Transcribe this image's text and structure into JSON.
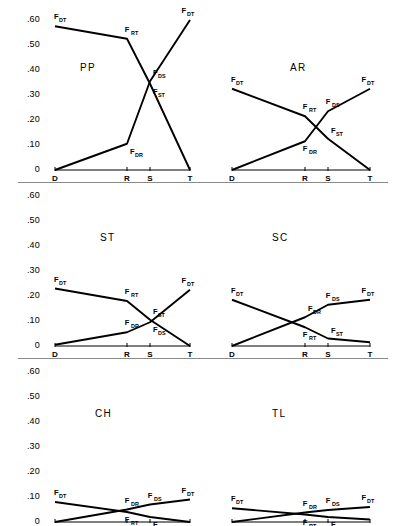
{
  "figure": {
    "axis_y_ticks": [
      ".60",
      ".50",
      ".40",
      ".30",
      ".20",
      ".10",
      "0"
    ],
    "axis_y_values": [
      0.6,
      0.5,
      0.4,
      0.3,
      0.2,
      0.1,
      0
    ],
    "axis_x_ticks": [
      "D",
      "R",
      "S",
      "T"
    ],
    "row_separator_color": "#8a8a8a",
    "line_color": "#000000"
  },
  "chart_data": [
    {
      "type": "line",
      "title": "PP",
      "panel": "top-left",
      "x": [
        "D",
        "R",
        "S",
        "T"
      ],
      "xlabel": "",
      "ylabel": "",
      "ylim": [
        0,
        0.6
      ],
      "grid": false,
      "legend": "inline-labels",
      "series": [
        {
          "name": "F_DT descending",
          "values": [
            0.575,
            0.525,
            0.345,
            0.0
          ],
          "labels": [
            {
              "text": "F",
              "sub": "DT",
              "at": "D",
              "pos": "above-left"
            },
            {
              "text": "F",
              "sub": "RT",
              "at": "R",
              "pos": "above"
            },
            {
              "text": "F",
              "sub": "ST",
              "at": "S",
              "pos": "below-right"
            }
          ]
        },
        {
          "name": "F_DR ascending",
          "values": [
            0.0,
            0.105,
            0.355,
            0.6
          ],
          "labels": [
            {
              "text": "F",
              "sub": "DR",
              "at": "R",
              "pos": "below-right"
            },
            {
              "text": "F",
              "sub": "DS",
              "at": "S",
              "pos": "above-right"
            },
            {
              "text": "F",
              "sub": "DT",
              "at": "T",
              "pos": "above"
            }
          ]
        }
      ]
    },
    {
      "type": "line",
      "title": "AR",
      "panel": "top-right",
      "x": [
        "D",
        "R",
        "S",
        "T"
      ],
      "xlabel": "",
      "ylabel": "",
      "ylim": [
        0,
        0.6
      ],
      "grid": false,
      "legend": "inline-labels",
      "series": [
        {
          "name": "F_DT descending",
          "values": [
            0.325,
            0.215,
            0.125,
            0.0
          ],
          "labels": [
            {
              "text": "F",
              "sub": "DT",
              "at": "D",
              "pos": "above-left"
            },
            {
              "text": "F",
              "sub": "RT",
              "at": "R",
              "pos": "above"
            },
            {
              "text": "F",
              "sub": "ST",
              "at": "S",
              "pos": "above-right"
            }
          ]
        },
        {
          "name": "F_DR ascending",
          "values": [
            0.0,
            0.115,
            0.235,
            0.325
          ],
          "labels": [
            {
              "text": "F",
              "sub": "DR",
              "at": "R",
              "pos": "below"
            },
            {
              "text": "F",
              "sub": "DS",
              "at": "S",
              "pos": "above"
            },
            {
              "text": "F",
              "sub": "DT",
              "at": "T",
              "pos": "above"
            }
          ]
        }
      ]
    },
    {
      "type": "line",
      "title": "ST",
      "panel": "middle-left",
      "x": [
        "D",
        "R",
        "S",
        "T"
      ],
      "xlabel": "",
      "ylabel": "",
      "ylim": [
        0,
        0.6
      ],
      "grid": false,
      "legend": "inline-labels",
      "series": [
        {
          "name": "F_DT descending",
          "values": [
            0.23,
            0.18,
            0.105,
            0.0
          ],
          "labels": [
            {
              "text": "F",
              "sub": "DT",
              "at": "D",
              "pos": "above-left"
            },
            {
              "text": "F",
              "sub": "RT",
              "at": "R",
              "pos": "above"
            },
            {
              "text": "F",
              "sub": "ST",
              "at": "S",
              "pos": "above-right"
            }
          ]
        },
        {
          "name": "F_DR ascending",
          "values": [
            0.005,
            0.055,
            0.095,
            0.225
          ],
          "labels": [
            {
              "text": "F",
              "sub": "DR",
              "at": "R",
              "pos": "above"
            },
            {
              "text": "F",
              "sub": "DS",
              "at": "S",
              "pos": "below-right"
            },
            {
              "text": "F",
              "sub": "DT",
              "at": "T",
              "pos": "above"
            }
          ]
        }
      ]
    },
    {
      "type": "line",
      "title": "SC",
      "panel": "middle-right",
      "x": [
        "D",
        "R",
        "S",
        "T"
      ],
      "xlabel": "",
      "ylabel": "",
      "ylim": [
        0,
        0.6
      ],
      "grid": false,
      "legend": "inline-labels",
      "series": [
        {
          "name": "F_DT descending",
          "values": [
            0.185,
            0.075,
            0.03,
            0.015
          ],
          "labels": [
            {
              "text": "F",
              "sub": "DT",
              "at": "D",
              "pos": "above-left"
            },
            {
              "text": "F",
              "sub": "RT",
              "at": "R",
              "pos": "below"
            },
            {
              "text": "F",
              "sub": "ST",
              "at": "S",
              "pos": "above-right"
            }
          ]
        },
        {
          "name": "F_DR ascending",
          "values": [
            0.0,
            0.115,
            0.165,
            0.185
          ],
          "labels": [
            {
              "text": "F",
              "sub": "DR",
              "at": "R",
              "pos": "above-right"
            },
            {
              "text": "F",
              "sub": "DS",
              "at": "S",
              "pos": "above"
            },
            {
              "text": "F",
              "sub": "DT",
              "at": "T",
              "pos": "above"
            }
          ]
        }
      ]
    },
    {
      "type": "line",
      "title": "CH",
      "panel": "bottom-left",
      "x": [
        "D",
        "R",
        "S",
        "T"
      ],
      "xlabel": "",
      "ylabel": "",
      "ylim": [
        0,
        0.6
      ],
      "grid": false,
      "legend": "inline-labels",
      "series": [
        {
          "name": "F_DT descending",
          "values": [
            0.08,
            0.04,
            0.02,
            0.0
          ],
          "labels": [
            {
              "text": "F",
              "sub": "DT",
              "at": "D",
              "pos": "above-left"
            },
            {
              "text": "F",
              "sub": "RT",
              "at": "R",
              "pos": "below"
            },
            {
              "text": "F",
              "sub": "ST",
              "at": "S",
              "pos": "below-right"
            }
          ]
        },
        {
          "name": "F_DR ascending",
          "values": [
            0.0,
            0.05,
            0.07,
            0.09
          ],
          "labels": [
            {
              "text": "F",
              "sub": "DR",
              "at": "R",
              "pos": "above"
            },
            {
              "text": "F",
              "sub": "DS",
              "at": "S",
              "pos": "above"
            },
            {
              "text": "F",
              "sub": "DT",
              "at": "T",
              "pos": "above"
            }
          ]
        }
      ]
    },
    {
      "type": "line",
      "title": "TL",
      "panel": "bottom-right",
      "x": [
        "D",
        "R",
        "S",
        "T"
      ],
      "xlabel": "",
      "ylabel": "",
      "ylim": [
        0,
        0.6
      ],
      "grid": false,
      "legend": "inline-labels",
      "series": [
        {
          "name": "F_DT descending",
          "values": [
            0.055,
            0.03,
            0.02,
            0.01
          ],
          "labels": [
            {
              "text": "F",
              "sub": "DT",
              "at": "D",
              "pos": "above-left"
            },
            {
              "text": "F",
              "sub": "RT",
              "at": "R",
              "pos": "below"
            },
            {
              "text": "F",
              "sub": "ST",
              "at": "S",
              "pos": "below-right"
            }
          ]
        },
        {
          "name": "F_DR ascending",
          "values": [
            0.0,
            0.038,
            0.048,
            0.06
          ],
          "labels": [
            {
              "text": "F",
              "sub": "DR",
              "at": "R",
              "pos": "above"
            },
            {
              "text": "F",
              "sub": "DS",
              "at": "S",
              "pos": "above"
            },
            {
              "text": "F",
              "sub": "DT",
              "at": "T",
              "pos": "above"
            }
          ]
        }
      ]
    }
  ]
}
